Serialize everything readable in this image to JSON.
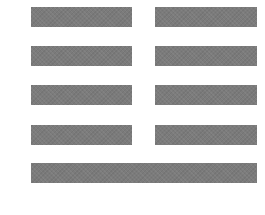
{
  "figure": {
    "type": "hexagram-lines",
    "color": "#7b7b7b",
    "lines_top_to_bottom": [
      "broken",
      "broken",
      "broken",
      "broken",
      "solid"
    ]
  }
}
